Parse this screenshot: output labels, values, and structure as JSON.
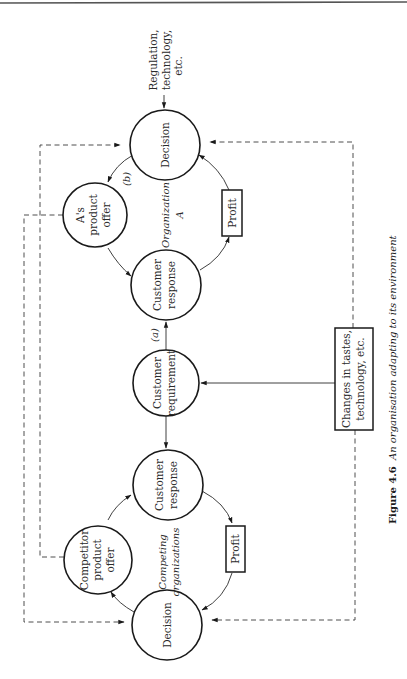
{
  "figure": {
    "number": "Figure 4.6",
    "caption": "An organisation adapting to its environment"
  },
  "organization_a": {
    "group_label_line1": "Organization",
    "group_label_line2": "A",
    "decision": "Decision",
    "product_offer_line1": "A's",
    "product_offer_line2": "product",
    "product_offer_line3": "offer",
    "customer_response_line1": "Customer",
    "customer_response_line2": "response",
    "profit": "Profit",
    "edge_label_b": "(b)"
  },
  "shared": {
    "customer_requirement_line1": "Customer",
    "customer_requirement_line2": "requirement",
    "edge_label_a": "(a)",
    "external_top_line1": "Regulation,",
    "external_top_line2": "technology,",
    "external_top_line3": "etc.",
    "changes_box_line1": "Changes in tastes,",
    "changes_box_line2": "technology, etc."
  },
  "competitors": {
    "group_label_line1": "Competing",
    "group_label_line2": "organizations",
    "decision": "Decision",
    "product_offer_line1": "Competitor",
    "product_offer_line2": "product",
    "product_offer_line3": "offer",
    "customer_response_line1": "Customer",
    "customer_response_line2": "response",
    "profit": "Profit"
  }
}
